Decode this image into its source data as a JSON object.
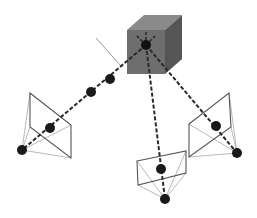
{
  "diagram": {
    "type": "multi-view camera geometry",
    "colors": {
      "cube_front": "#6e6e6e",
      "cube_top": "#8a8a8a",
      "cube_side": "#555555",
      "ray": "#2a2a2a",
      "point": "#1a1a1a",
      "frustum_plane": "#555555",
      "frustum_edge": "#b0b0b0"
    },
    "object": {
      "name": "cube",
      "center_point": [
        146,
        45
      ]
    },
    "normal_line": {
      "from": [
        96,
        38
      ],
      "to": [
        121,
        66
      ]
    },
    "cameras": [
      {
        "name": "left-camera",
        "center": [
          22,
          150
        ],
        "plane": [
          [
            30,
            93
          ],
          [
            71,
            125
          ],
          [
            71,
            158
          ],
          [
            30,
            127
          ]
        ],
        "projection": [
          50,
          128
        ],
        "ray_extra_points": [
          [
            91,
            92
          ],
          [
            110,
            79
          ]
        ]
      },
      {
        "name": "bottom-camera",
        "center": [
          165,
          199
        ],
        "plane": [
          [
            137,
            161
          ],
          [
            186,
            151
          ],
          [
            186,
            173
          ],
          [
            138,
            185
          ]
        ],
        "projection": [
          161,
          169
        ],
        "ray_extra_points": []
      },
      {
        "name": "right-camera",
        "center": [
          237,
          153
        ],
        "plane": [
          [
            189,
            124
          ],
          [
            229,
            93
          ],
          [
            231,
            127
          ],
          [
            189,
            157
          ]
        ],
        "projection": [
          216,
          126
        ],
        "ray_extra_points": []
      }
    ]
  }
}
